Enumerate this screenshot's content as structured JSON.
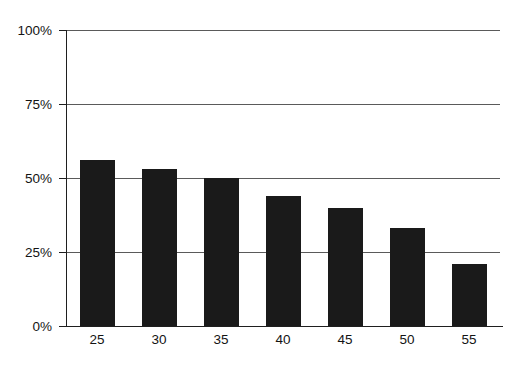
{
  "chart_data": {
    "type": "bar",
    "title": "",
    "subtitle": "",
    "xlabel": "",
    "ylabel": "",
    "categories": [
      "25",
      "30",
      "35",
      "40",
      "45",
      "50",
      "55"
    ],
    "values": [
      56,
      53,
      50,
      44,
      40,
      33,
      21
    ],
    "series": [
      {
        "name": "",
        "values": [
          56,
          53,
          50,
          44,
          40,
          33,
          21
        ]
      }
    ],
    "ylim": [
      0,
      100
    ],
    "ytick_values": [
      100,
      75,
      50,
      25,
      0
    ],
    "ytick_labels": [
      "100%",
      "75%",
      "50%",
      "25%",
      "0%"
    ],
    "xtick_labels": [
      "25",
      "30",
      "35",
      "40",
      "45",
      "50",
      "55"
    ],
    "grid": true,
    "grid_axis": "y",
    "legend": false,
    "legend_position": "none",
    "bar_color": "#1a1a1a",
    "grid_color": "#5a5a5a",
    "axis_color": "#1f1f1f",
    "background_color": "#ffffff",
    "annotations": []
  }
}
